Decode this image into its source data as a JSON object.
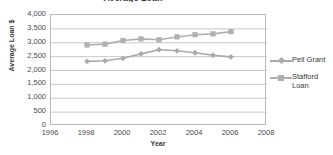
{
  "chart_data": {
    "type": "line",
    "title": "Average Loan",
    "xlabel": "Year",
    "ylabel": "Average Loan $",
    "x": [
      1998,
      1999,
      2000,
      2001,
      2002,
      2003,
      2004,
      2005,
      2006
    ],
    "xlim": [
      1996,
      2008
    ],
    "ylim": [
      0,
      4000
    ],
    "xticks": [
      "1996",
      "1998",
      "2000",
      "2002",
      "2004",
      "2006",
      "2008"
    ],
    "yticks": [
      "0",
      "500",
      "1,000",
      "1,500",
      "2,000",
      "2,500",
      "3,000",
      "3,500",
      "4,000"
    ],
    "grid": "horizontal",
    "legend_position": "right",
    "series": [
      {
        "name": "Pell Grant",
        "marker": "diamond",
        "color": "#aaaaaa",
        "values": [
          2330,
          2350,
          2440,
          2600,
          2750,
          2710,
          2640,
          2550,
          2490
        ]
      },
      {
        "name": "Stafford Loan",
        "marker": "square",
        "color": "#b0b0b0",
        "values": [
          2920,
          2950,
          3080,
          3140,
          3110,
          3210,
          3290,
          3320,
          3400
        ]
      }
    ]
  },
  "legend": {
    "entries": [
      {
        "label": "Pell Grant"
      },
      {
        "label": "Stafford\nLoan"
      }
    ]
  },
  "colors": {
    "grid": "#c8c8c8",
    "axis": "#b9b9b9",
    "text": "#3b3b3b",
    "pell": "#aaaaaa",
    "stafford": "#b0b0b0"
  }
}
